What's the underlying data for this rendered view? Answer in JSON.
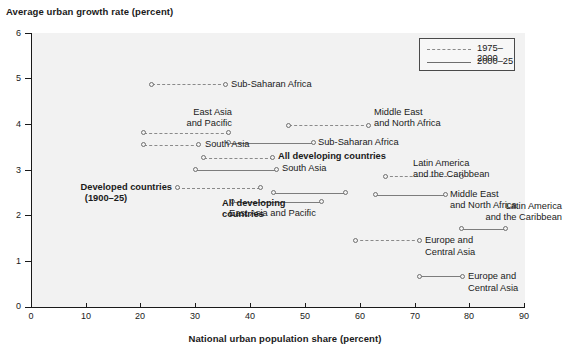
{
  "chart_data": {
    "type": "line",
    "title": "",
    "ylabel": "Average urban growth rate (percent)",
    "xlabel": "National urban population share (percent)",
    "xlim": [
      0,
      90
    ],
    "ylim": [
      0,
      6
    ],
    "xticks": [
      "0",
      "10",
      "20",
      "30",
      "40",
      "50",
      "60",
      "70",
      "80",
      "90"
    ],
    "yticks": [
      "0",
      "1",
      "2",
      "3",
      "4",
      "5",
      "6"
    ],
    "grid": false,
    "legend_position": "top-right",
    "legend": [
      {
        "label": "1975–2000",
        "style": "dashed"
      },
      {
        "label": "2000–25",
        "style": "solid"
      }
    ],
    "series": [
      {
        "name": "Sub-Saharan Africa",
        "period": "1975–2000",
        "style": "dashed",
        "start": {
          "x": 22.0,
          "y": 4.88
        },
        "end": {
          "x": 35.5,
          "y": 4.88
        },
        "label": "Sub-Saharan Africa",
        "label_pos": "right"
      },
      {
        "name": "East Asia and Pacific",
        "period": "1975–2000",
        "style": "dashed",
        "start": {
          "x": 20.5,
          "y": 3.82
        },
        "end": {
          "x": 36.0,
          "y": 3.82
        },
        "label": "East Asia\nand Pacific",
        "label_pos": "left-above"
      },
      {
        "name": "South Asia",
        "period": "1975–2000",
        "style": "dashed",
        "start": {
          "x": 20.5,
          "y": 3.55
        },
        "end": {
          "x": 30.6,
          "y": 3.55
        },
        "label": "South Asia",
        "label_pos": "right"
      },
      {
        "name": "Middle East and North Africa",
        "period": "1975–2000",
        "style": "dashed",
        "start": {
          "x": 47.0,
          "y": 3.98
        },
        "end": {
          "x": 61.5,
          "y": 3.98
        },
        "label": "Middle East\nand North Africa",
        "label_pos": "right-above"
      },
      {
        "name": "Sub-Saharan Africa",
        "period": "2000–25",
        "style": "solid",
        "start": {
          "x": 36.0,
          "y": 3.6
        },
        "end": {
          "x": 51.5,
          "y": 3.6
        },
        "label": "Sub-Saharan Africa",
        "label_pos": "right"
      },
      {
        "name": "All developing countries",
        "period": "1975–2000",
        "style": "dashed",
        "start": {
          "x": 31.5,
          "y": 3.27
        },
        "end": {
          "x": 44.0,
          "y": 3.27
        },
        "label": "All developing countries",
        "label_pos": "right",
        "bold": true
      },
      {
        "name": "South Asia",
        "period": "2000–25",
        "style": "solid",
        "start": {
          "x": 30.0,
          "y": 3.01
        },
        "end": {
          "x": 44.7,
          "y": 3.01
        },
        "label": "South Asia",
        "label_pos": "right"
      },
      {
        "name": "Latin America and the Caribbean",
        "period": "1975–2000",
        "style": "dashed",
        "start": {
          "x": 64.5,
          "y": 2.86
        },
        "end": {
          "x": 78.5,
          "y": 2.86
        },
        "label": "Latin America\nand the Caribbean",
        "label_pos": "right-above"
      },
      {
        "name": "Developed countries (1900–25)",
        "period": "1975–2000",
        "style": "dashed",
        "start": {
          "x": 26.6,
          "y": 2.61
        },
        "end": {
          "x": 41.8,
          "y": 2.61
        },
        "label": "Developed countries\n(1900–25)",
        "label_pos": "left",
        "bold": true
      },
      {
        "name": "Middle East and North Africa",
        "period": "2000–25",
        "style": "solid",
        "start": {
          "x": 62.8,
          "y": 2.46
        },
        "end": {
          "x": 75.5,
          "y": 2.46
        },
        "label": "Middle East\nand North Africa",
        "label_pos": "right-below"
      },
      {
        "name": "All developing countries",
        "period": "2000–25",
        "style": "solid",
        "start": {
          "x": 44.2,
          "y": 2.5
        },
        "end": {
          "x": 57.3,
          "y": 2.5
        },
        "label": "All developing\ncountries",
        "label_pos": "right-below",
        "bold": true
      },
      {
        "name": "East Asia and Pacific",
        "period": "2000–25",
        "style": "solid",
        "start": {
          "x": 36.7,
          "y": 2.3
        },
        "end": {
          "x": 52.9,
          "y": 2.3
        },
        "label": "East Asia and Pacific",
        "label_pos": "below"
      },
      {
        "name": "Latin America and the Caribbean",
        "period": "2000–25",
        "style": "solid",
        "start": {
          "x": 78.4,
          "y": 1.71
        },
        "end": {
          "x": 86.5,
          "y": 1.71
        },
        "label": "Latin America\nand the Caribbean",
        "label_pos": "above"
      },
      {
        "name": "Europe and Central Asia",
        "period": "1975–2000",
        "style": "dashed",
        "start": {
          "x": 59.1,
          "y": 1.46
        },
        "end": {
          "x": 70.8,
          "y": 1.46
        },
        "label": "Europe and\nCentral Asia",
        "label_pos": "right"
      },
      {
        "name": "Europe and Central Asia",
        "period": "2000–25",
        "style": "solid",
        "start": {
          "x": 70.8,
          "y": 0.67
        },
        "end": {
          "x": 78.6,
          "y": 0.67
        },
        "label": "Europe and\nCentral Asia",
        "label_pos": "right"
      }
    ]
  },
  "labels": {
    "sub_saharan_1": "Sub-Saharan Africa",
    "east_asia_pacific_1a": "East Asia",
    "east_asia_pacific_1b": "and Pacific",
    "south_asia_1": "South Asia",
    "mena_1a": "Middle East",
    "mena_1b": "and North Africa",
    "sub_saharan_2": "Sub-Saharan Africa",
    "all_dev_1": "All developing countries",
    "south_asia_2": "South Asia",
    "lac_1a": "Latin America",
    "lac_1b": "and the Caribbean",
    "developed_a": "Developed countries",
    "developed_b": "(1900–25)",
    "mena_2a": "Middle East",
    "mena_2b": "and North Africa",
    "all_dev_2a": "All developing",
    "all_dev_2b": "countries",
    "east_asia_pacific_2": "East Asia and Pacific",
    "lac_2a": "Latin America",
    "lac_2b": "and the Caribbean",
    "eca_1a": "Europe and",
    "eca_1b": "Central Asia",
    "eca_2a": "Europe and",
    "eca_2b": "Central Asia"
  },
  "colors": {
    "plot_background": "#f2f2f2",
    "axis": "#1a1a1a",
    "dashed_line": "#8a8a8a",
    "solid_line": "#7d7d7d",
    "marker_edge": "#707070",
    "text": "#1a1a1a"
  }
}
